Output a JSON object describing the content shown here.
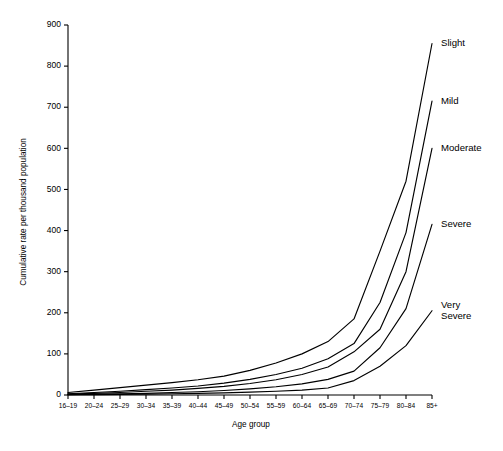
{
  "chart_data": {
    "type": "line",
    "title": "",
    "xlabel": "Age group",
    "ylabel": "Cumulative rate per thousand population",
    "categories": [
      "16–19",
      "20–24",
      "25–29",
      "30–34",
      "35–39",
      "40–44",
      "45–49",
      "50–54",
      "55–59",
      "60–64",
      "65–69",
      "70–74",
      "75–79",
      "80–84",
      "85+"
    ],
    "ylim": [
      0,
      900
    ],
    "yticks": [
      0,
      100,
      200,
      300,
      400,
      500,
      600,
      700,
      800,
      900
    ],
    "ytick_labels": [
      "0",
      "100",
      "200",
      "300",
      "400",
      "500",
      "600",
      "700",
      "800",
      "900"
    ],
    "grid": false,
    "legend": "inline-right-of-line-end",
    "series": [
      {
        "name": "Slight",
        "label": "Slight",
        "label_lines": [
          "Slight"
        ],
        "values": [
          6,
          12,
          18,
          24,
          30,
          37,
          46,
          60,
          78,
          100,
          130,
          185,
          350,
          520,
          855
        ]
      },
      {
        "name": "Mild",
        "label": "Mild",
        "label_lines": [
          "Mild"
        ],
        "values": [
          3,
          6,
          9,
          13,
          17,
          22,
          29,
          38,
          50,
          65,
          88,
          125,
          225,
          395,
          715
        ]
      },
      {
        "name": "Moderate",
        "label": "Moderate",
        "label_lines": [
          "Moderate"
        ],
        "values": [
          2,
          4,
          6,
          9,
          12,
          16,
          21,
          28,
          37,
          50,
          68,
          105,
          160,
          300,
          600
        ]
      },
      {
        "name": "Severe",
        "label": "Severe",
        "label_lines": [
          "Severe"
        ],
        "values": [
          1,
          2,
          3,
          4,
          6,
          8,
          11,
          15,
          20,
          27,
          38,
          58,
          115,
          210,
          415
        ]
      },
      {
        "name": "Very Severe",
        "label": "Very Severe",
        "label_lines": [
          "Very",
          "Severe"
        ],
        "values": [
          0.5,
          1,
          1.5,
          2,
          3,
          4,
          5,
          7,
          9,
          12,
          17,
          35,
          70,
          120,
          205
        ]
      }
    ]
  }
}
